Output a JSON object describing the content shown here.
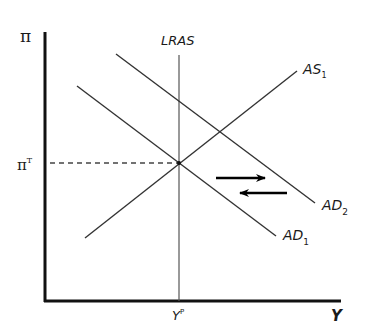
{
  "diagram": {
    "y_axis": {
      "label": "π"
    },
    "x_axis": {
      "label": "Y"
    },
    "inflation_target": {
      "symbol": "π",
      "superscript": "T"
    },
    "potential_output": {
      "symbol": "Y",
      "superscript": "P"
    },
    "curves": {
      "lras": {
        "label": "LRAS"
      },
      "as1": {
        "label": "AS",
        "subscript": "1"
      },
      "ad1": {
        "label": "AD",
        "subscript": "1"
      },
      "ad2": {
        "label": "AD",
        "subscript": "2"
      }
    },
    "arrows": [
      {
        "direction": "right",
        "meaning": "shift from AD1 to AD2"
      },
      {
        "direction": "left",
        "meaning": "shift from AD2 back to AD1"
      }
    ],
    "colors": {
      "axis": "#111111",
      "curve": "#333333",
      "lras": "#555555",
      "arrow": "#000000",
      "dashed": "#444444"
    }
  }
}
